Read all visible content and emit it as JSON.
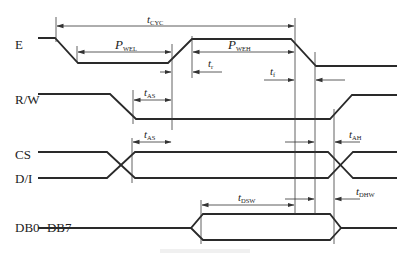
{
  "diagram": {
    "type": "timing-diagram",
    "signals": [
      {
        "id": "E",
        "label": "E"
      },
      {
        "id": "RW",
        "label": "R/W"
      },
      {
        "id": "CS",
        "label": "CS"
      },
      {
        "id": "DI",
        "label": "D/I"
      },
      {
        "id": "DB",
        "label": "DB0−DB7"
      }
    ],
    "timing_params": {
      "tcyc": {
        "main": "t",
        "sub": "CYC"
      },
      "pwel": {
        "main": "P",
        "sub": "WEL"
      },
      "pweh": {
        "main": "P",
        "sub": "WEH"
      },
      "tr": {
        "main": "t",
        "sub": "r"
      },
      "tf": {
        "main": "t",
        "sub": "f"
      },
      "tas1": {
        "main": "t",
        "sub": "AS"
      },
      "tas2": {
        "main": "t",
        "sub": "AS"
      },
      "tah": {
        "main": "t",
        "sub": "AH"
      },
      "tdsw": {
        "main": "t",
        "sub": "DSW"
      },
      "tdhw": {
        "main": "t",
        "sub": "DHW"
      }
    },
    "colors": {
      "line": "#2a2a2a",
      "background": "#ffffff"
    }
  }
}
